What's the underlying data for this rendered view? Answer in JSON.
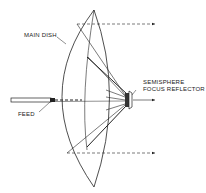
{
  "diagram": {
    "labels": {
      "main_dish": "MAIN DISH",
      "semisphere_line1": "SEMISPHERE",
      "semisphere_line2": "FOCUS REFLECTOR",
      "feed": "FEED"
    },
    "colors": {
      "line": "#222222",
      "background": "#ffffff"
    }
  }
}
